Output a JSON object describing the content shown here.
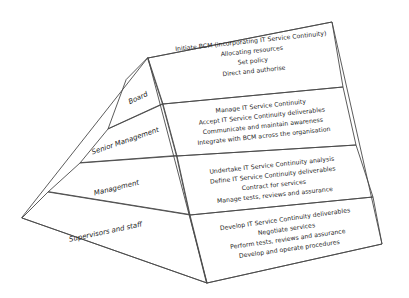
{
  "diagram": {
    "type": "pyramid",
    "background_color": "#ffffff",
    "line_color": "#4a4a4a",
    "text_color": "#1c1c1c",
    "tiers": [
      {
        "role_label": "Board",
        "activities": [
          "Initiate BCM (incorporating IT Service Continuity)",
          "Allocating resources",
          "Set policy",
          "Direct and authorise"
        ]
      },
      {
        "role_label": "Senior Management",
        "activities": [
          "Manage IT Service Continuity",
          "Accept IT Service Continuity deliverables",
          "Communicate and maintain awareness",
          "Integrate with BCM across the organisation"
        ]
      },
      {
        "role_label": "Management",
        "activities": [
          "Undertake IT Service Continuity analysis",
          "Define IT Service Continuity deliverables",
          "Contract for services",
          "Manage tests, reviews and assurance"
        ]
      },
      {
        "role_label": "Supervisors and staff",
        "activities": [
          "Develop IT Service Continuity deliverables",
          "Negotiate services",
          "Perform tests, reviews and assurance",
          "Develop and operate procedures"
        ]
      }
    ]
  }
}
